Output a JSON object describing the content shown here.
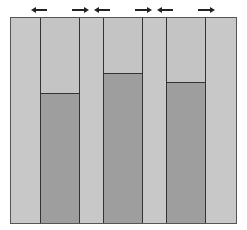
{
  "diagram": {
    "frame": {
      "x": 10,
      "y": 17,
      "width": 225,
      "height": 205
    },
    "columns": [
      {
        "left": 29,
        "width": 39,
        "bar_top": 93
      },
      {
        "left": 92,
        "width": 39,
        "bar_top": 73
      },
      {
        "left": 155,
        "width": 39,
        "bar_top": 82
      }
    ],
    "arrows": [
      {
        "direction": "left",
        "x": 34,
        "width": 13
      },
      {
        "direction": "right",
        "x": 72,
        "width": 14
      },
      {
        "direction": "left",
        "x": 97,
        "width": 13
      },
      {
        "direction": "right",
        "x": 135,
        "width": 14
      },
      {
        "direction": "left",
        "x": 160,
        "width": 13
      },
      {
        "direction": "right",
        "x": 198,
        "width": 14
      }
    ],
    "colors": {
      "background": "#c8c8c8",
      "bar": "#9e9e9e",
      "stroke": "#333333"
    }
  }
}
